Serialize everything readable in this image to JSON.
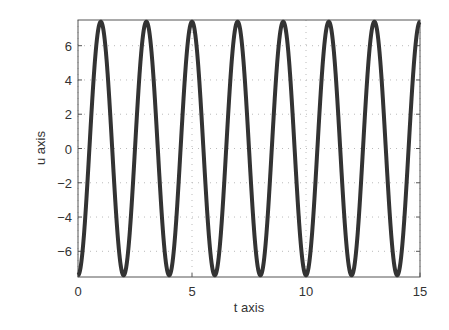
{
  "chart_data": {
    "type": "line",
    "title": "",
    "xlabel": "t axis",
    "ylabel": "u axis",
    "xlim": [
      0,
      15
    ],
    "ylim": [
      -7.5,
      7.5
    ],
    "xticks": [
      0,
      5,
      10,
      15
    ],
    "yticks": [
      -6,
      -4,
      -2,
      0,
      2,
      4,
      6
    ],
    "grid": true,
    "legend": null,
    "series": [
      {
        "name": "u(t)",
        "color": "#333333",
        "function": "-7.4*cos(pi*t)",
        "x": [
          0,
          1,
          2,
          3,
          4,
          5,
          6,
          7,
          8,
          9,
          10,
          11,
          12,
          13,
          14,
          15
        ],
        "values": [
          -7.4,
          7.4,
          -7.4,
          7.4,
          -7.4,
          7.4,
          -7.4,
          7.4,
          -7.4,
          7.4,
          -7.4,
          7.4,
          -7.4,
          7.4,
          -7.4,
          7.4
        ]
      }
    ]
  },
  "axes": {
    "x_label": "t axis",
    "y_label": "u axis",
    "x_tick_labels": [
      "0",
      "5",
      "10",
      "15"
    ],
    "y_tick_labels": [
      "6",
      "4",
      "2",
      "0",
      "−2",
      "−4",
      "−6"
    ]
  }
}
